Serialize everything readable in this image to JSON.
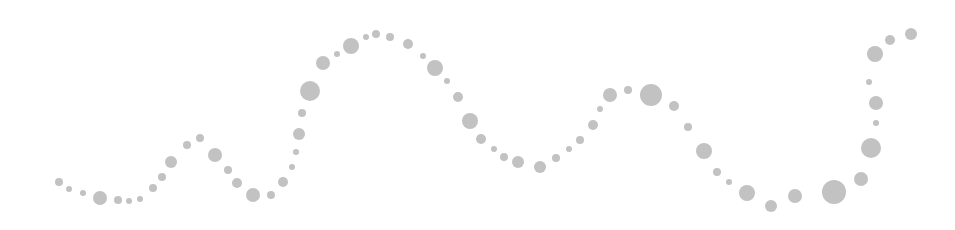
{
  "canvas": {
    "width": 955,
    "height": 230,
    "background": "#ffffff"
  },
  "style": {
    "dot_color": "#c2c2c2"
  },
  "dots": [
    {
      "x": 59,
      "y": 182,
      "r": 4
    },
    {
      "x": 69,
      "y": 189,
      "r": 3
    },
    {
      "x": 83,
      "y": 193,
      "r": 3
    },
    {
      "x": 100,
      "y": 198,
      "r": 7
    },
    {
      "x": 118,
      "y": 200,
      "r": 4
    },
    {
      "x": 129,
      "y": 201,
      "r": 3
    },
    {
      "x": 140,
      "y": 199,
      "r": 3
    },
    {
      "x": 153,
      "y": 188,
      "r": 4
    },
    {
      "x": 162,
      "y": 177,
      "r": 4
    },
    {
      "x": 171,
      "y": 162,
      "r": 6
    },
    {
      "x": 187,
      "y": 145,
      "r": 4
    },
    {
      "x": 200,
      "y": 138,
      "r": 4
    },
    {
      "x": 215,
      "y": 155,
      "r": 7
    },
    {
      "x": 228,
      "y": 170,
      "r": 4
    },
    {
      "x": 237,
      "y": 183,
      "r": 5
    },
    {
      "x": 253,
      "y": 195,
      "r": 7
    },
    {
      "x": 271,
      "y": 195,
      "r": 4
    },
    {
      "x": 283,
      "y": 182,
      "r": 5
    },
    {
      "x": 292,
      "y": 167,
      "r": 3
    },
    {
      "x": 296,
      "y": 152,
      "r": 3
    },
    {
      "x": 299,
      "y": 134,
      "r": 6
    },
    {
      "x": 302,
      "y": 113,
      "r": 4
    },
    {
      "x": 310,
      "y": 91,
      "r": 10
    },
    {
      "x": 323,
      "y": 63,
      "r": 7
    },
    {
      "x": 337,
      "y": 54,
      "r": 3
    },
    {
      "x": 351,
      "y": 46,
      "r": 8
    },
    {
      "x": 366,
      "y": 37,
      "r": 3
    },
    {
      "x": 376,
      "y": 34,
      "r": 4
    },
    {
      "x": 390,
      "y": 37,
      "r": 4
    },
    {
      "x": 408,
      "y": 44,
      "r": 5
    },
    {
      "x": 423,
      "y": 56,
      "r": 3
    },
    {
      "x": 435,
      "y": 68,
      "r": 8
    },
    {
      "x": 447,
      "y": 81,
      "r": 3
    },
    {
      "x": 458,
      "y": 97,
      "r": 5
    },
    {
      "x": 470,
      "y": 121,
      "r": 8
    },
    {
      "x": 481,
      "y": 139,
      "r": 5
    },
    {
      "x": 494,
      "y": 149,
      "r": 3
    },
    {
      "x": 504,
      "y": 157,
      "r": 4
    },
    {
      "x": 518,
      "y": 162,
      "r": 6
    },
    {
      "x": 540,
      "y": 167,
      "r": 6
    },
    {
      "x": 556,
      "y": 158,
      "r": 4
    },
    {
      "x": 569,
      "y": 149,
      "r": 3
    },
    {
      "x": 580,
      "y": 140,
      "r": 4
    },
    {
      "x": 593,
      "y": 125,
      "r": 5
    },
    {
      "x": 600,
      "y": 109,
      "r": 3
    },
    {
      "x": 610,
      "y": 95,
      "r": 7
    },
    {
      "x": 628,
      "y": 90,
      "r": 4
    },
    {
      "x": 651,
      "y": 95,
      "r": 11
    },
    {
      "x": 674,
      "y": 106,
      "r": 5
    },
    {
      "x": 688,
      "y": 127,
      "r": 4
    },
    {
      "x": 704,
      "y": 151,
      "r": 8
    },
    {
      "x": 717,
      "y": 172,
      "r": 4
    },
    {
      "x": 729,
      "y": 182,
      "r": 3
    },
    {
      "x": 747,
      "y": 193,
      "r": 8
    },
    {
      "x": 771,
      "y": 206,
      "r": 6
    },
    {
      "x": 795,
      "y": 196,
      "r": 7
    },
    {
      "x": 834,
      "y": 192,
      "r": 12
    },
    {
      "x": 861,
      "y": 179,
      "r": 7
    },
    {
      "x": 871,
      "y": 148,
      "r": 10
    },
    {
      "x": 876,
      "y": 123,
      "r": 3
    },
    {
      "x": 876,
      "y": 103,
      "r": 7
    },
    {
      "x": 869,
      "y": 82,
      "r": 3
    },
    {
      "x": 875,
      "y": 54,
      "r": 8
    },
    {
      "x": 890,
      "y": 40,
      "r": 5
    },
    {
      "x": 911,
      "y": 34,
      "r": 6
    }
  ]
}
